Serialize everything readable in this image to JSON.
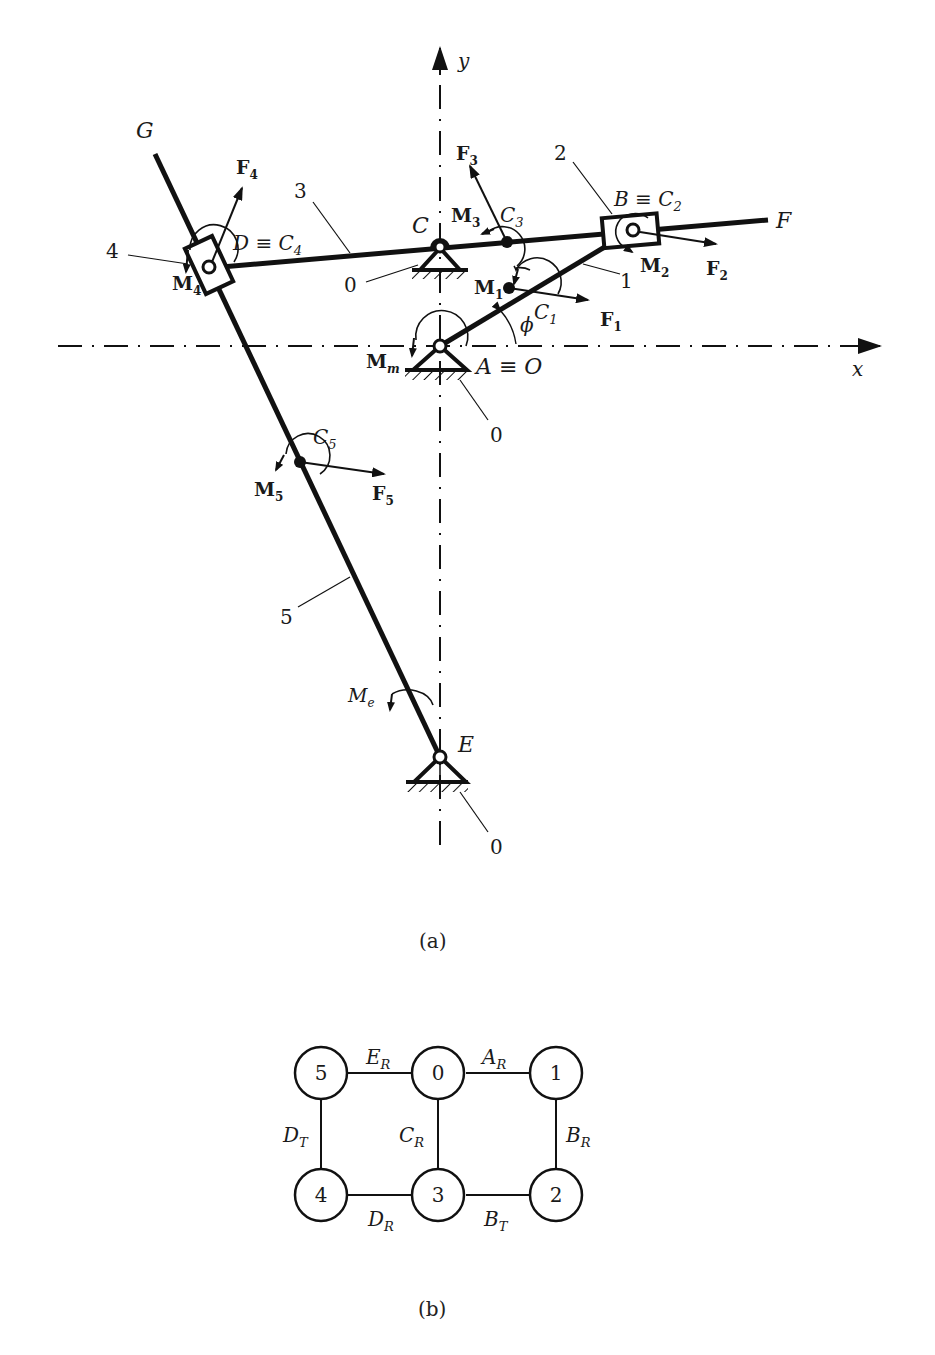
{
  "figure_a": {
    "caption": "(a)",
    "axes": {
      "x_label": "x",
      "y_label": "y"
    },
    "points": {
      "G": "G",
      "F": "F",
      "C": "C",
      "E": "E",
      "D": "D ≡ C",
      "D_sub": "4",
      "B": "B ≡ C",
      "B_sub": "2",
      "A": "A ≡ O",
      "C1": "C",
      "C1_sub": "1",
      "C3": "C",
      "C3_sub": "3",
      "C5": "C",
      "C5_sub": "5",
      "phi": "ϕ"
    },
    "forces": [
      {
        "name": "F",
        "sub": "1"
      },
      {
        "name": "F",
        "sub": "2"
      },
      {
        "name": "F",
        "sub": "3"
      },
      {
        "name": "F",
        "sub": "4"
      },
      {
        "name": "F",
        "sub": "5"
      }
    ],
    "moments": [
      {
        "name": "M",
        "sub": "1"
      },
      {
        "name": "M",
        "sub": "2"
      },
      {
        "name": "M",
        "sub": "3"
      },
      {
        "name": "M",
        "sub": "4"
      },
      {
        "name": "M",
        "sub": "5"
      },
      {
        "name": "M",
        "sub": "m"
      },
      {
        "name": "M",
        "sub": "e"
      }
    ],
    "link_numbers": {
      "link1": "1",
      "link2": "2",
      "link3": "3",
      "link4": "4",
      "link5": "5",
      "ground_C": "0",
      "ground_A": "0",
      "ground_E": "0"
    }
  },
  "figure_b": {
    "caption": "(b)",
    "nodes": [
      "0",
      "1",
      "2",
      "3",
      "4",
      "5"
    ],
    "edges": [
      {
        "from": "5",
        "to": "0",
        "label": "E",
        "sub": "R"
      },
      {
        "from": "0",
        "to": "1",
        "label": "A",
        "sub": "R"
      },
      {
        "from": "1",
        "to": "2",
        "label": "B",
        "sub": "R"
      },
      {
        "from": "2",
        "to": "3",
        "label": "B",
        "sub": "T"
      },
      {
        "from": "0",
        "to": "3",
        "label": "C",
        "sub": "R"
      },
      {
        "from": "3",
        "to": "4",
        "label": "D",
        "sub": "R"
      },
      {
        "from": "5",
        "to": "4",
        "label": "D",
        "sub": "T"
      }
    ]
  }
}
